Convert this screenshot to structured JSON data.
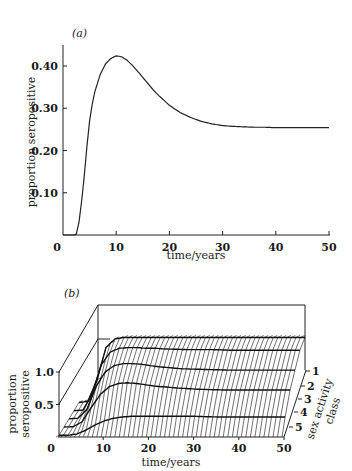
{
  "chart_data": [
    {
      "panel": "(a)",
      "type": "line",
      "title": "",
      "xlabel": "time/years",
      "ylabel": "proportion seropositive",
      "xlim": [
        0,
        50
      ],
      "ylim": [
        0,
        0.45
      ],
      "xticks": [
        0,
        10,
        20,
        30,
        40,
        50
      ],
      "xtick_labels": [
        "0",
        "10",
        "20",
        "30",
        "40",
        "50"
      ],
      "yticks": [
        0.1,
        0.2,
        0.3,
        0.4
      ],
      "ytick_labels": [
        "0.10",
        "0.20",
        "0.30",
        "0.40"
      ],
      "grid": false,
      "legend": null,
      "series": [
        {
          "name": "proportion seropositive",
          "x": [
            0,
            1,
            2,
            2.5,
            3,
            3.5,
            4,
            4.5,
            5,
            5.5,
            6,
            7,
            8,
            9,
            10,
            11,
            12,
            13,
            14,
            15,
            16,
            17,
            18,
            20,
            22,
            24,
            26,
            28,
            30,
            32,
            34,
            36,
            38,
            40,
            45,
            50
          ],
          "values": [
            0,
            0,
            0,
            0.002,
            0.03,
            0.08,
            0.14,
            0.21,
            0.27,
            0.31,
            0.34,
            0.38,
            0.405,
            0.418,
            0.424,
            0.422,
            0.414,
            0.402,
            0.388,
            0.373,
            0.358,
            0.343,
            0.33,
            0.307,
            0.29,
            0.278,
            0.269,
            0.263,
            0.259,
            0.257,
            0.256,
            0.255,
            0.255,
            0.254,
            0.254,
            0.254
          ]
        }
      ]
    },
    {
      "panel": "(b)",
      "type": "surface",
      "title": "",
      "xlabel": "time/years",
      "ylabel": "proportion seropositive",
      "zlabel": "sex activity class",
      "xlim": [
        0,
        50
      ],
      "zlim": [
        0,
        1.0
      ],
      "xticks": [
        0,
        10,
        20,
        30,
        40,
        50
      ],
      "xtick_labels": [
        "0",
        "10",
        "20",
        "30",
        "40",
        "50"
      ],
      "zticks": [
        0.5,
        1.0
      ],
      "ztick_labels": [
        "0.5",
        "1.0"
      ],
      "class_ticks": [
        "1",
        "2",
        "3",
        "4",
        "5"
      ],
      "grid": false,
      "legend": null,
      "x": [
        0,
        2,
        4,
        6,
        8,
        10,
        12,
        14,
        16,
        18,
        20,
        25,
        30,
        35,
        40,
        45,
        50
      ],
      "series": [
        {
          "name": "class 1",
          "values": [
            0,
            0.02,
            0.35,
            0.85,
            0.98,
            1.0,
            1.0,
            1.0,
            1.0,
            1.0,
            1.0,
            1.0,
            1.0,
            1.0,
            1.0,
            1.0,
            1.0
          ]
        },
        {
          "name": "class 2",
          "values": [
            0,
            0.01,
            0.25,
            0.7,
            0.9,
            0.96,
            0.97,
            0.97,
            0.96,
            0.96,
            0.95,
            0.94,
            0.94,
            0.93,
            0.93,
            0.93,
            0.93
          ]
        },
        {
          "name": "class 3",
          "values": [
            0,
            0.01,
            0.15,
            0.5,
            0.72,
            0.82,
            0.85,
            0.85,
            0.84,
            0.82,
            0.8,
            0.77,
            0.76,
            0.75,
            0.75,
            0.75,
            0.75
          ]
        },
        {
          "name": "class 4",
          "values": [
            0,
            0.005,
            0.08,
            0.3,
            0.5,
            0.62,
            0.67,
            0.68,
            0.67,
            0.65,
            0.63,
            0.6,
            0.58,
            0.57,
            0.57,
            0.57,
            0.57
          ]
        },
        {
          "name": "class 5",
          "values": [
            0,
            0.0,
            0.02,
            0.08,
            0.16,
            0.22,
            0.26,
            0.28,
            0.29,
            0.29,
            0.29,
            0.29,
            0.29,
            0.28,
            0.28,
            0.28,
            0.28
          ]
        }
      ]
    }
  ],
  "figure": {
    "panel_a_label": "(a)",
    "panel_b_label": "(b)",
    "a_ylabel": "proportion seropositive",
    "a_xlabel": "time/years",
    "b_ylabel_line1": "proportion",
    "b_ylabel_line2": "seropositive",
    "b_xlabel": "time/years",
    "b_zlabel": "sex activity",
    "b_zlabel2": "class"
  }
}
